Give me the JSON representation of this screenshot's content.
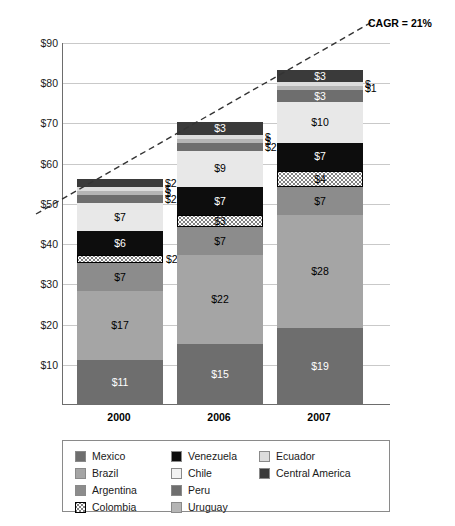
{
  "chart_data": {
    "type": "bar",
    "stacked": true,
    "title": "",
    "subtitle": "",
    "xlabel": "",
    "ylabel": "",
    "categories": [
      "2000",
      "2006",
      "2007"
    ],
    "ylim": [
      0,
      90
    ],
    "yticks": [
      "$10",
      "$20",
      "$30",
      "$40",
      "$50",
      "$60",
      "$70",
      "$80",
      "$90"
    ],
    "ytick_values": [
      10,
      20,
      30,
      40,
      50,
      60,
      70,
      80,
      90
    ],
    "grid": true,
    "legend_position": "bottom",
    "series": [
      {
        "name": "Mexico",
        "color": "#6e6e6e",
        "values": [
          11,
          15,
          19
        ],
        "labels": [
          "$11",
          "$15",
          "$19"
        ]
      },
      {
        "name": "Brazil",
        "color": "#a5a5a5",
        "values": [
          17,
          22,
          28
        ],
        "labels": [
          "$17",
          "$22",
          "$28"
        ]
      },
      {
        "name": "Argentina",
        "color": "#8c8c8c",
        "values": [
          7,
          7,
          7
        ],
        "labels": [
          "$7",
          "$7",
          "$7"
        ]
      },
      {
        "name": "Colombia",
        "color": "#ffffff",
        "pattern": "dots",
        "values": [
          2,
          3,
          4
        ],
        "labels": [
          "$2",
          "$3",
          "$4"
        ]
      },
      {
        "name": "Venezuela",
        "color": "#0d0d0d",
        "values": [
          6,
          7,
          7
        ],
        "labels": [
          "$6",
          "$7",
          "$7"
        ]
      },
      {
        "name": "Chile",
        "color": "#e8e8e8",
        "values": [
          7,
          9,
          10
        ],
        "labels": [
          "$7",
          "$9",
          "$10"
        ]
      },
      {
        "name": "Peru",
        "color": "#6e6e6e",
        "values": [
          2,
          2,
          3
        ],
        "labels": [
          "$2",
          "$2",
          "$3"
        ]
      },
      {
        "name": "Uruguay",
        "color": "#b5b5b5",
        "values": [
          1,
          1,
          1
        ],
        "labels": [
          "$",
          "$",
          "$1"
        ]
      },
      {
        "name": "Ecuador",
        "color": "#dcdcdc",
        "values": [
          1,
          1,
          1
        ],
        "labels": [
          "$",
          "$",
          "$"
        ]
      },
      {
        "name": "Central America",
        "color": "#3a3a3a",
        "values": [
          2,
          3,
          3
        ],
        "labels": [
          "$2",
          "$3",
          "$3"
        ]
      }
    ],
    "totals": [
      56,
      70,
      83
    ],
    "annotations": [
      {
        "name": "cagr",
        "text": "CAGR = 21%",
        "style": "dashed-trendline"
      }
    ]
  },
  "legend": {
    "columns": [
      [
        {
          "label": "Mexico",
          "color": "#6e6e6e",
          "pattern": "solid"
        },
        {
          "label": "Brazil",
          "color": "#a5a5a5",
          "pattern": "solid"
        },
        {
          "label": "Argentina",
          "color": "#8c8c8c",
          "pattern": "solid"
        },
        {
          "label": "Colombia",
          "color": "#ffffff",
          "pattern": "dots"
        }
      ],
      [
        {
          "label": "Venezuela",
          "color": "#0d0d0d",
          "pattern": "solid"
        },
        {
          "label": "Chile",
          "color": "#f2f2f2",
          "pattern": "solid"
        },
        {
          "label": "Peru",
          "color": "#6e6e6e",
          "pattern": "solid"
        },
        {
          "label": "Uruguay",
          "color": "#b5b5b5",
          "pattern": "solid"
        }
      ],
      [
        {
          "label": "Ecuador",
          "color": "#dcdcdc",
          "pattern": "solid"
        },
        {
          "label": "Central America",
          "color": "#3a3a3a",
          "pattern": "solid"
        }
      ]
    ]
  }
}
